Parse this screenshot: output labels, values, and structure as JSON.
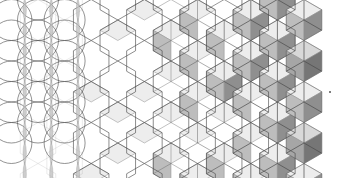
{
  "figure": {
    "title": "Circle to hexagon to isometric cube tessellation progression",
    "type": "geometric-illustration",
    "width": 337,
    "height": 178,
    "background": "#ffffff"
  },
  "palette": {
    "stroke": "#4a4a4a",
    "stroke_light": "#8c8c8c",
    "face_top": "#ededed",
    "face_left": "#bdbdbd",
    "face_right": "#8f8f8f",
    "face_top_dark": "#d8d8d8",
    "face_left_dark": "#a6a6a6",
    "face_right_dark": "#767676",
    "white": "#ffffff",
    "speck": "#555555"
  },
  "geometry": {
    "hex_radius": 20.5,
    "hex_width": 35.5,
    "hex_height": 41,
    "column_step": 26.6,
    "row_step": 41,
    "origin_x": 38,
    "origin_y": 20,
    "columns": 11,
    "rows": 4,
    "circle_radius": 20.5,
    "circle_columns": 3,
    "circle_rows": 5
  },
  "zones": [
    {
      "name": "circles-zone",
      "label": "Overlapping circle lattice (flower of life)",
      "x_start": 16,
      "x_end": 78,
      "fill_level": 0.0,
      "shows": "circle outlines only, vertical vesica slivers lightly shaded"
    },
    {
      "name": "hexagons-zone",
      "label": "Plain hexagon honeycomb outlines",
      "x_start": 78,
      "x_end": 150,
      "fill_level": 0.15,
      "shows": "empty white hexagons with thin outlines"
    },
    {
      "name": "transition-zone",
      "label": "Partially shaded rhombi",
      "x_start": 150,
      "x_end": 232,
      "fill_level": 0.55,
      "shows": "one or two of the three rhombi per hexagon filled light grey"
    },
    {
      "name": "cubes-zone",
      "label": "Full isometric cubes",
      "x_start": 232,
      "x_end": 316,
      "fill_level": 1.0,
      "shows": "all three rhombi shaded: light top, mid left face, dark right face"
    }
  ],
  "annotations": [
    {
      "name": "corner-speck",
      "shape": "dot",
      "x": 330,
      "y": 92,
      "size": 2,
      "color": "#555555"
    }
  ],
  "legend": {
    "visible": false,
    "entries": [
      {
        "label": "Top face",
        "color": "#ededed"
      },
      {
        "label": "Left face",
        "color": "#bdbdbd"
      },
      {
        "label": "Right face",
        "color": "#8f8f8f"
      }
    ]
  }
}
